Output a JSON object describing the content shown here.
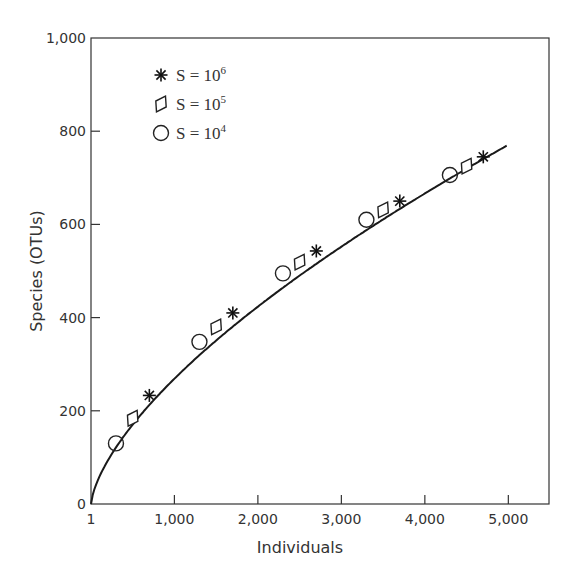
{
  "chart_data": {
    "type": "line",
    "title": "",
    "xlabel": "Individuals",
    "ylabel": "Species (OTUs)",
    "xlim": [
      1,
      5500
    ],
    "ylim": [
      0,
      1000
    ],
    "grid": false,
    "legend_position": "upper-left",
    "x_ticks": [
      1,
      1000,
      2000,
      3000,
      4000,
      5000
    ],
    "x_tick_labels": [
      "1",
      "1,000",
      "2,000",
      "3,000",
      "4,000",
      "5,000"
    ],
    "y_ticks": [
      0,
      200,
      400,
      600,
      800,
      1000
    ],
    "y_tick_labels": [
      "0",
      "200",
      "400",
      "600",
      "800",
      "1,000"
    ],
    "curve": {
      "name": "rarefaction curve",
      "x": [
        1,
        50,
        100,
        200,
        300,
        500,
        700,
        1000,
        1300,
        1500,
        1700,
        2000,
        2300,
        2500,
        2700,
        3000,
        3300,
        3500,
        3700,
        4000,
        4300,
        4500,
        4700,
        5000
      ],
      "y": [
        0,
        38,
        60,
        95,
        130,
        184,
        233,
        298,
        348,
        380,
        410,
        455,
        495,
        519,
        543,
        578,
        610,
        631,
        650,
        680,
        706,
        725,
        745,
        770
      ]
    },
    "series": [
      {
        "name": "S = 10^6",
        "label_base": "S = 10",
        "label_exp": "6",
        "marker": "asterisk",
        "x": [
          700,
          1700,
          2700,
          3700,
          4700
        ],
        "y": [
          233,
          410,
          543,
          650,
          745
        ]
      },
      {
        "name": "S = 10^5",
        "label_base": "S = 10",
        "label_exp": "5",
        "marker": "diamond",
        "x": [
          500,
          1500,
          2500,
          3500,
          4500
        ],
        "y": [
          184,
          380,
          519,
          631,
          725
        ]
      },
      {
        "name": "S = 10^4",
        "label_base": "S = 10",
        "label_exp": "4",
        "marker": "circle",
        "x": [
          300,
          1300,
          2300,
          3300,
          4300
        ],
        "y": [
          130,
          348,
          495,
          610,
          706
        ]
      }
    ],
    "colors": {
      "line": "#1a1a1a",
      "axis": "#333333",
      "text": "#333333"
    }
  }
}
